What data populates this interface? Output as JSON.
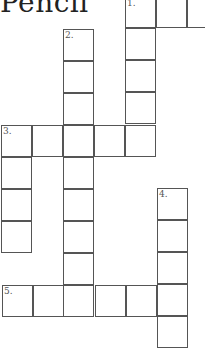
{
  "title": "Pencil",
  "grid": {
    "cell_size": 31,
    "line_color": "#555555",
    "clues": [
      {
        "number": "1.",
        "direction": "down",
        "label": "1."
      },
      {
        "number": "2.",
        "direction": "down",
        "label": "2."
      },
      {
        "number": "3.",
        "direction": "across",
        "label": "3."
      },
      {
        "number": "4.",
        "direction": "down",
        "label": "4."
      },
      {
        "number": "5.",
        "direction": "across",
        "label": "5."
      }
    ]
  }
}
